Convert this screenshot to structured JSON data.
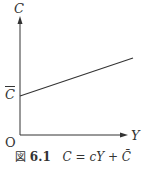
{
  "diagram": {
    "y_axis_label": "C",
    "x_axis_label": "Y",
    "origin_label": "O",
    "intercept_label": "C",
    "line": {
      "x1": 20,
      "y1": 96,
      "x2": 133,
      "y2": 58
    },
    "axis_color": "#333333",
    "line_color": "#333333"
  },
  "caption": {
    "figure_prefix": "図",
    "figure_number": "6.1",
    "equation": "C = cY + C̄"
  }
}
